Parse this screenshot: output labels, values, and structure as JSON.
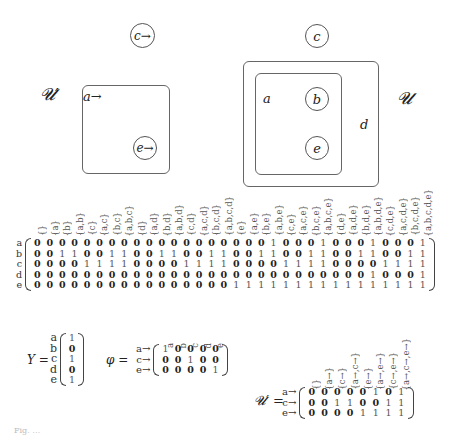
{
  "left_diagram": {
    "label": "𝓤′",
    "outer_circle": "c→",
    "box_corner_label": "a→",
    "inner_circle": "e→"
  },
  "right_diagram": {
    "label": "𝓤",
    "top_circle": "c",
    "outer_label": "d",
    "inner_label": "a",
    "inner_circle_top": "b",
    "inner_circle_bottom": "e"
  },
  "main_matrix": {
    "row_labels": [
      "a",
      "b",
      "c",
      "d",
      "e"
    ],
    "column_headers": [
      "{}",
      "{a}",
      "{b}",
      "{a,b}",
      "{c}",
      "{a,c}",
      "{b,c}",
      "{a,b,c}",
      "{d}",
      "{a,d}",
      "{b,d}",
      "{a,b,d}",
      "{c,d}",
      "{a,c,d}",
      "{b,c,d}",
      "{a,b,c,d}",
      "{e}",
      "{a,e}",
      "{b,e}",
      "{a,b,e}",
      "{c,e}",
      "{a,c,e}",
      "{b,c,e}",
      "{a,b,c,e}",
      "{d,e}",
      "{a,d,e}",
      "{b,d,e}",
      "{a,b,d,e}",
      "{c,d,e}",
      "{a,c,d,e}",
      "{b,c,d,e}",
      "{a,b,c,d,e}"
    ],
    "rows": [
      [
        0,
        0,
        0,
        0,
        0,
        0,
        0,
        0,
        0,
        0,
        0,
        0,
        0,
        0,
        0,
        0,
        0,
        0,
        0,
        1,
        0,
        0,
        0,
        1,
        0,
        0,
        0,
        1,
        0,
        0,
        0,
        1
      ],
      [
        0,
        0,
        1,
        1,
        0,
        0,
        1,
        1,
        0,
        0,
        1,
        1,
        0,
        0,
        1,
        1,
        0,
        0,
        1,
        1,
        0,
        0,
        1,
        1,
        0,
        0,
        1,
        1,
        0,
        0,
        1,
        1
      ],
      [
        0,
        0,
        0,
        0,
        1,
        1,
        1,
        1,
        0,
        0,
        0,
        0,
        1,
        1,
        1,
        1,
        0,
        0,
        0,
        0,
        1,
        1,
        1,
        1,
        0,
        0,
        0,
        0,
        1,
        1,
        1,
        1
      ],
      [
        0,
        0,
        0,
        0,
        0,
        0,
        0,
        0,
        0,
        0,
        0,
        0,
        0,
        0,
        0,
        0,
        0,
        0,
        0,
        0,
        0,
        0,
        0,
        0,
        0,
        0,
        0,
        1,
        0,
        0,
        0,
        1
      ],
      [
        0,
        0,
        0,
        0,
        0,
        0,
        0,
        0,
        0,
        0,
        0,
        0,
        0,
        0,
        0,
        0,
        1,
        1,
        1,
        1,
        1,
        1,
        1,
        1,
        1,
        1,
        1,
        1,
        1,
        1,
        1,
        1
      ]
    ]
  },
  "y_vector": {
    "label": "Y =",
    "row_labels": [
      "a",
      "b",
      "c",
      "d",
      "e"
    ],
    "values": [
      1,
      0,
      1,
      0,
      1
    ]
  },
  "phi_matrix": {
    "label": "φ =",
    "row_labels": [
      "a→",
      "c→",
      "e→"
    ],
    "column_headers": [
      "a",
      "b",
      "c",
      "d",
      "e"
    ],
    "rows": [
      [
        1,
        0,
        0,
        0,
        0
      ],
      [
        0,
        0,
        1,
        0,
        0
      ],
      [
        0,
        0,
        0,
        0,
        1
      ]
    ]
  },
  "u_prime_matrix": {
    "label": "𝓤′ =",
    "row_labels": [
      "a→",
      "c→",
      "e→"
    ],
    "column_headers": [
      "{}",
      "{a→}",
      "{c→}",
      "{a→,c→}",
      "{e→}",
      "{a→,e→}",
      "{c→,e→}",
      "{a→,c→,e→}"
    ],
    "rows": [
      [
        0,
        0,
        0,
        0,
        0,
        1,
        0,
        1
      ],
      [
        0,
        0,
        1,
        1,
        0,
        0,
        1,
        1
      ],
      [
        0,
        0,
        0,
        0,
        1,
        1,
        1,
        1
      ]
    ]
  },
  "caption": "Fig. …"
}
